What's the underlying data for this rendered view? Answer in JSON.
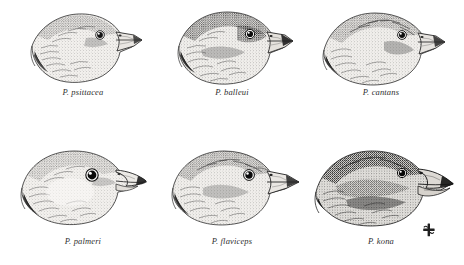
{
  "plate": {
    "background_color": "#ffffff",
    "ink_color": "#262626",
    "medium": "pen-and-ink stipple drawing",
    "layout": "2 rows x 3 columns of bird head profiles, each with an italic species caption below",
    "subject": "Psittirostra finch-billed honeycreeper head profiles, all facing right"
  },
  "specimens": [
    {
      "id": "psittacea",
      "caption": "P. psittacea",
      "row": 1,
      "column": 1,
      "bill": "stout conical finch bill, moderately deep, slightly decurved culmen tip",
      "shading": "light to medium stipple, pale throat"
    },
    {
      "id": "bailleui",
      "caption": "P. balleui",
      "row": 1,
      "column": 2,
      "bill": "heavy conical bill with dark tip",
      "shading": "dark crown and eye mask, paler cheek and throat"
    },
    {
      "id": "cantans",
      "caption": "P. cantans",
      "row": 1,
      "column": 3,
      "bill": "long stout conical bill, pointed",
      "shading": "streaked crown, medium stipple on nape"
    },
    {
      "id": "palmeri",
      "caption": "P. palmeri",
      "row": 2,
      "column": 1,
      "bill": "large hooked bill, strongly decurved upper mandible",
      "shading": "large prominent eye, pale cheek, dark bill tip"
    },
    {
      "id": "flaviceps",
      "caption": "P. flaviceps",
      "row": 2,
      "column": 2,
      "bill": "long deep conical bill, straight culmen",
      "shading": "mottled crown and nape, bold eye"
    },
    {
      "id": "kona",
      "caption": "P. kona",
      "row": 2,
      "column": 3,
      "bill": "very large massive conical bill, deepest of the series",
      "shading": "darkest overall, heavy stipple across crown, cheek and throat"
    }
  ],
  "signature": {
    "label": "artist monogram",
    "description": "small cross-shaped ink monogram at lower right of the plate"
  }
}
